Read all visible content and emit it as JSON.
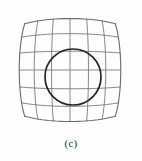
{
  "figure": {
    "caption": "(c)",
    "background_color": "#fdfdfc",
    "grid": {
      "line_color": "#7b7b7b",
      "border_color": "#6a6a6a",
      "line_width": 0.9,
      "border_width": 1.1,
      "columns": 6,
      "rows": 6,
      "distortion_type": "pincushion",
      "distortion_strength": 0.19,
      "bounds": {
        "x0": 14,
        "y0": 13,
        "x1": 126,
        "y1": 127
      }
    },
    "circle": {
      "stroke_color": "#262626",
      "line_width": 1.7,
      "fill": "none",
      "center_x": 73,
      "center_y": 77,
      "radius": 28
    }
  },
  "chart_data": {
    "type": "diagram",
    "title": "(c)",
    "subtitle": "",
    "xlabel": "",
    "ylabel": "",
    "series": [
      {
        "name": "grid-mesh",
        "columns": 6,
        "rows": 6,
        "vertical_lines": 7,
        "horizontal_lines": 7,
        "distortion": "pincushion",
        "k": 0.19
      },
      {
        "name": "circle-overlay",
        "center": [
          73,
          77
        ],
        "radius": 28
      }
    ],
    "legend": [],
    "grid": true
  }
}
